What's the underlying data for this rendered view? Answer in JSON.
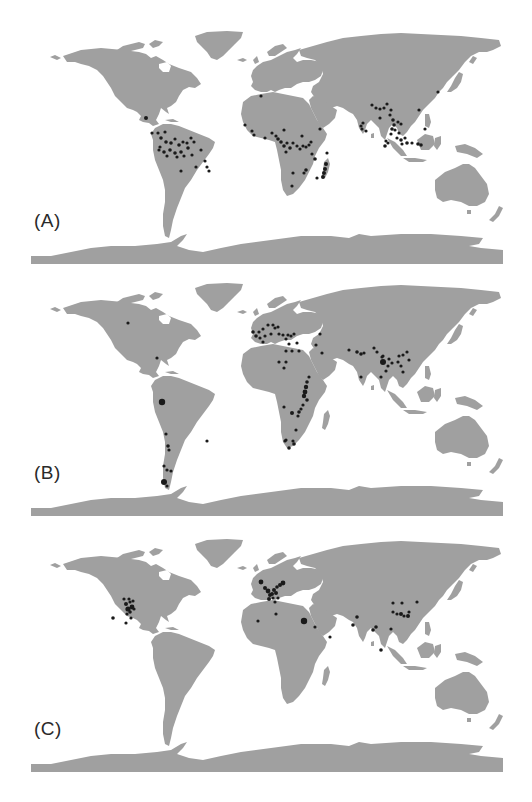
{
  "figure": {
    "land_color": "#a0a0a0",
    "dot_color": "#1a1a1a",
    "background": "#ffffff",
    "projection": "world map (equirectangular-like), Antarctica strip at bottom"
  },
  "panels": [
    {
      "label": "(A)",
      "dot_regions": [
        "Central America",
        "Amazon basin",
        "Eastern Brazil",
        "West Africa",
        "Congo basin",
        "East Africa",
        "Madagascar",
        "South Asia",
        "Southeast Asia",
        "Indonesia",
        "Japan"
      ],
      "dots": [
        [
          115,
          88,
          2
        ],
        [
          121,
          103,
          1.6
        ],
        [
          127,
          103,
          1.6
        ],
        [
          134,
          102,
          1.6
        ],
        [
          130,
          108,
          1.8
        ],
        [
          135,
          112,
          1.8
        ],
        [
          140,
          113,
          1.8
        ],
        [
          144,
          109,
          1.6
        ],
        [
          148,
          115,
          1.8
        ],
        [
          152,
          112,
          1.6
        ],
        [
          156,
          113,
          1.6
        ],
        [
          160,
          108,
          1.6
        ],
        [
          163,
          112,
          1.6
        ],
        [
          157,
          118,
          1.8
        ],
        [
          150,
          122,
          1.8
        ],
        [
          144,
          123,
          1.8
        ],
        [
          139,
          120,
          1.8
        ],
        [
          133,
          122,
          1.8
        ],
        [
          128,
          120,
          1.6
        ],
        [
          136,
          126,
          1.6
        ],
        [
          146,
          127,
          1.6
        ],
        [
          153,
          126,
          1.6
        ],
        [
          161,
          125,
          1.6
        ],
        [
          170,
          120,
          1.6
        ],
        [
          165,
          137,
          1.6
        ],
        [
          174,
          131,
          1.6
        ],
        [
          176,
          137,
          1.6
        ],
        [
          178,
          141,
          1.6
        ],
        [
          150,
          141,
          1.6
        ],
        [
          129,
          117,
          1.6
        ],
        [
          230,
          66,
          1.6
        ],
        [
          214,
          95,
          1.6
        ],
        [
          221,
          101,
          1.6
        ],
        [
          223,
          105,
          1.6
        ],
        [
          234,
          108,
          1.6
        ],
        [
          241,
          103,
          1.6
        ],
        [
          245,
          106,
          1.6
        ],
        [
          247,
          109,
          1.8
        ],
        [
          250,
          112,
          1.8
        ],
        [
          253,
          116,
          1.8
        ],
        [
          256,
          113,
          1.6
        ],
        [
          259,
          118,
          1.8
        ],
        [
          255,
          122,
          1.6
        ],
        [
          262,
          113,
          1.6
        ],
        [
          266,
          116,
          1.6
        ],
        [
          269,
          119,
          1.6
        ],
        [
          272,
          116,
          1.6
        ],
        [
          275,
          117,
          1.6
        ],
        [
          278,
          115,
          1.6
        ],
        [
          271,
          106,
          1.6
        ],
        [
          280,
          112,
          1.6
        ],
        [
          281,
          124,
          1.6
        ],
        [
          275,
          140,
          1.8
        ],
        [
          273,
          143,
          1.6
        ],
        [
          262,
          143,
          1.6
        ],
        [
          253,
          100,
          1.6
        ],
        [
          289,
          99,
          1.6
        ],
        [
          286,
          148,
          1.6
        ],
        [
          261,
          156,
          1.6
        ],
        [
          284,
          129,
          1.8
        ],
        [
          296,
          123,
          1.6
        ],
        [
          295,
          134,
          2
        ],
        [
          294,
          139,
          2
        ],
        [
          293,
          143,
          2
        ],
        [
          292,
          147,
          2
        ],
        [
          341,
          75,
          1.6
        ],
        [
          345,
          78,
          1.6
        ],
        [
          349,
          79,
          1.6
        ],
        [
          353,
          78,
          1.6
        ],
        [
          356,
          74,
          1.6
        ],
        [
          360,
          80,
          1.6
        ],
        [
          359,
          85,
          1.6
        ],
        [
          362,
          90,
          1.8
        ],
        [
          363,
          95,
          1.8
        ],
        [
          361,
          99,
          1.8
        ],
        [
          364,
          100,
          1.6
        ],
        [
          367,
          92,
          1.6
        ],
        [
          370,
          94,
          1.6
        ],
        [
          368,
          103,
          1.6
        ],
        [
          366,
          108,
          1.6
        ],
        [
          370,
          110,
          1.8
        ],
        [
          374,
          108,
          1.6
        ],
        [
          376,
          113,
          1.8
        ],
        [
          371,
          114,
          1.6
        ],
        [
          381,
          113,
          1.6
        ],
        [
          387,
          114,
          1.8
        ],
        [
          390,
          115,
          1.8
        ],
        [
          360,
          104,
          1.6
        ],
        [
          357,
          113,
          1.6
        ],
        [
          354,
          116,
          1.8
        ],
        [
          349,
          88,
          1.6
        ],
        [
          332,
          93,
          1.6
        ],
        [
          330,
          96,
          1.6
        ],
        [
          331,
          99,
          1.6
        ],
        [
          335,
          101,
          1.6
        ],
        [
          388,
          80,
          1.6
        ],
        [
          394,
          99,
          1.6
        ],
        [
          407,
          62,
          1.6
        ],
        [
          355,
          111,
          1.6
        ]
      ]
    },
    {
      "label": "(B)",
      "dot_regions": [
        "North America (central)",
        "Caribbean",
        "Ecuador/Colombia",
        "Andes",
        "Patagonia",
        "NE Brazil",
        "Europe",
        "Mediterranean",
        "North Africa",
        "Sahel",
        "East African Rift",
        "Southern Africa",
        "Middle East",
        "Himalaya",
        "China",
        "South India"
      ],
      "dots": [
        [
          97,
          41,
          1.6
        ],
        [
          126,
          76,
          1.6
        ],
        [
          131,
          120,
          3.2
        ],
        [
          135,
          152,
          1.6
        ],
        [
          137,
          164,
          1.8
        ],
        [
          138,
          168,
          1.6
        ],
        [
          176,
          159,
          1.6
        ],
        [
          133,
          184,
          1.6
        ],
        [
          136,
          188,
          1.6
        ],
        [
          140,
          189,
          1.6
        ],
        [
          133,
          200,
          3
        ],
        [
          136,
          204,
          1.6
        ],
        [
          228,
          50,
          1.6
        ],
        [
          232,
          47,
          1.6
        ],
        [
          237,
          43,
          1.6
        ],
        [
          242,
          43,
          1.6
        ],
        [
          244,
          46,
          1.6
        ],
        [
          247,
          45,
          1.6
        ],
        [
          222,
          50,
          1.8
        ],
        [
          225,
          54,
          1.8
        ],
        [
          229,
          56,
          1.6
        ],
        [
          234,
          54,
          1.6
        ],
        [
          240,
          52,
          1.6
        ],
        [
          232,
          60,
          1.6
        ],
        [
          248,
          52,
          1.6
        ],
        [
          252,
          53,
          1.6
        ],
        [
          257,
          53,
          1.6
        ],
        [
          260,
          54,
          1.6
        ],
        [
          263,
          52,
          1.6
        ],
        [
          255,
          57,
          1.6
        ],
        [
          258,
          62,
          1.6
        ],
        [
          266,
          61,
          1.6
        ],
        [
          289,
          52,
          1.6
        ],
        [
          291,
          71,
          1.6
        ],
        [
          255,
          69,
          1.6
        ],
        [
          261,
          69,
          1.6
        ],
        [
          268,
          69,
          1.6
        ],
        [
          253,
          86,
          1.6
        ],
        [
          248,
          80,
          1.6
        ],
        [
          255,
          80,
          1.6
        ],
        [
          278,
          95,
          1.6
        ],
        [
          276,
          100,
          1.8
        ],
        [
          275,
          105,
          2.2
        ],
        [
          274,
          110,
          2.4
        ],
        [
          273,
          114,
          2.2
        ],
        [
          276,
          118,
          1.8
        ],
        [
          272,
          123,
          1.6
        ],
        [
          270,
          127,
          1.6
        ],
        [
          268,
          130,
          1.8
        ],
        [
          267,
          134,
          1.6
        ],
        [
          261,
          131,
          2
        ],
        [
          253,
          125,
          1.6
        ],
        [
          265,
          148,
          1.6
        ],
        [
          262,
          159,
          1.6
        ],
        [
          255,
          158,
          1.6
        ],
        [
          263,
          162,
          1.8
        ],
        [
          258,
          166,
          1.8
        ],
        [
          254,
          159,
          1.6
        ],
        [
          318,
          68,
          1.6
        ],
        [
          326,
          70,
          1.8
        ],
        [
          330,
          72,
          1.8
        ],
        [
          333,
          71,
          1.6
        ],
        [
          343,
          66,
          1.6
        ],
        [
          352,
          74,
          1.6
        ],
        [
          351,
          75,
          1.6
        ],
        [
          352,
          80,
          3
        ],
        [
          357,
          84,
          1.6
        ],
        [
          355,
          89,
          1.6
        ],
        [
          350,
          95,
          1.6
        ],
        [
          358,
          77,
          1.6
        ],
        [
          361,
          81,
          1.6
        ],
        [
          368,
          74,
          1.6
        ],
        [
          372,
          73,
          1.6
        ],
        [
          367,
          80,
          1.6
        ],
        [
          370,
          84,
          1.6
        ],
        [
          376,
          70,
          1.6
        ],
        [
          378,
          78,
          1.6
        ],
        [
          372,
          90,
          1.6
        ],
        [
          346,
          70,
          1.6
        ],
        [
          330,
          95,
          1.6
        ],
        [
          285,
          63,
          1.6
        ]
      ]
    },
    {
      "label": "(C)",
      "dot_regions": [
        "US Great Plains / Rocky Mountains",
        "California",
        "US Southwest",
        "Western Europe",
        "North Africa",
        "Egypt / Nile",
        "Middle East",
        "Arabian Peninsula",
        "Indus",
        "Himalaya",
        "China",
        "Southeast Asia",
        "Korea"
      ],
      "dots": [
        [
          93,
          61,
          1.6
        ],
        [
          98,
          61,
          1.6
        ],
        [
          95,
          66,
          2
        ],
        [
          97,
          71,
          2.6
        ],
        [
          101,
          69,
          2.4
        ],
        [
          99,
          74,
          1.8
        ],
        [
          96,
          76,
          1.6
        ],
        [
          100,
          80,
          1.6
        ],
        [
          103,
          71,
          1.6
        ],
        [
          99,
          64,
          1.6
        ],
        [
          102,
          63,
          1.6
        ],
        [
          82,
          80,
          1.8
        ],
        [
          95,
          85,
          1.6
        ],
        [
          230,
          44,
          2.4
        ],
        [
          234,
          50,
          2
        ],
        [
          237,
          53,
          2.4
        ],
        [
          239,
          57,
          2
        ],
        [
          238,
          61,
          2
        ],
        [
          241,
          56,
          2
        ],
        [
          243,
          52,
          2
        ],
        [
          246,
          49,
          1.8
        ],
        [
          249,
          47,
          2
        ],
        [
          252,
          45,
          2.4
        ],
        [
          242,
          60,
          1.6
        ],
        [
          245,
          55,
          2
        ],
        [
          247,
          60,
          1.6
        ],
        [
          244,
          64,
          1.6
        ],
        [
          227,
          83,
          1.6
        ],
        [
          245,
          76,
          1.6
        ],
        [
          273,
          83,
          3.2
        ],
        [
          284,
          89,
          1.6
        ],
        [
          299,
          99,
          1.6
        ],
        [
          322,
          87,
          1.8
        ],
        [
          326,
          79,
          1.8
        ],
        [
          342,
          92,
          1.8
        ],
        [
          345,
          89,
          1.8
        ],
        [
          362,
          65,
          1.6
        ],
        [
          371,
          65,
          1.6
        ],
        [
          362,
          74,
          1.6
        ],
        [
          366,
          76,
          1.6
        ],
        [
          370,
          76,
          2
        ],
        [
          373,
          78,
          1.6
        ],
        [
          377,
          78,
          2
        ],
        [
          378,
          74,
          1.6
        ],
        [
          360,
          91,
          1.6
        ],
        [
          350,
          112,
          1.8
        ],
        [
          386,
          64,
          1.6
        ]
      ]
    }
  ]
}
